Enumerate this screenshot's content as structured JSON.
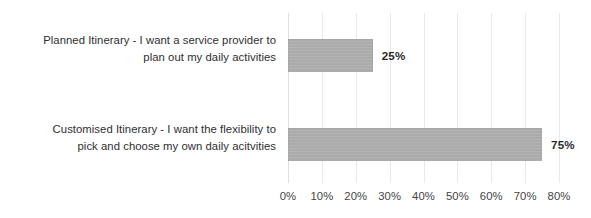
{
  "chart_data": {
    "type": "bar",
    "orientation": "horizontal",
    "title": "",
    "subtitle": "",
    "xlabel": "",
    "ylabel": "",
    "categories": [
      "Planned Itinerary - I want a service provider to plan out my daily activities",
      "Customised Itinerary - I want the flexibility to pick and choose my own daily acitvities"
    ],
    "category_lines": [
      [
        "Planned Itinerary - I want a service provider to",
        "plan out my daily activities"
      ],
      [
        "Customised Itinerary - I want the flexibility to",
        "pick and choose my own daily acitvities"
      ]
    ],
    "values": [
      25,
      75
    ],
    "value_labels": [
      "25%",
      "75%"
    ],
    "xlim": [
      0,
      80
    ],
    "xticks": [
      0,
      10,
      20,
      30,
      40,
      50,
      60,
      70,
      80
    ],
    "xtick_labels": [
      "0%",
      "10%",
      "20%",
      "30%",
      "40%",
      "50%",
      "60%",
      "70%",
      "80%"
    ],
    "grid": true,
    "grid_axis": "x",
    "legend": false,
    "legend_position": "none",
    "bar_color": "#a8a8a8",
    "grid_color": "#e8e8e8",
    "text_color": "#262626",
    "value_label_color": "#1d1d1d",
    "background_color": "#ffffff"
  }
}
